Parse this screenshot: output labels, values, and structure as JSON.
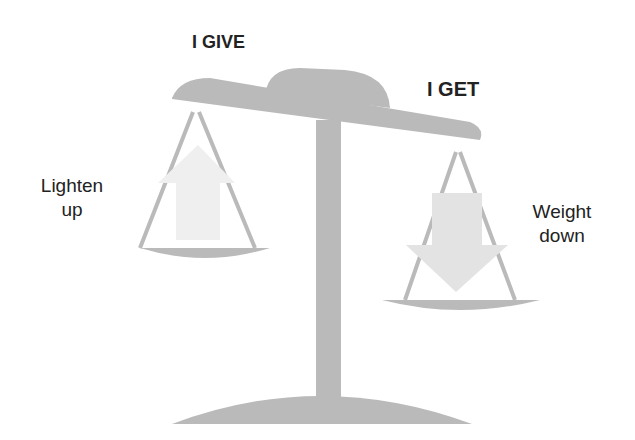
{
  "diagram": {
    "title_left": "I GIVE",
    "title_right": "I GET",
    "left_pan_label_line1": "Lighten",
    "left_pan_label_line2": "up",
    "right_pan_label_line1": "Weight",
    "right_pan_label_line2": "down",
    "colors": {
      "scale": "#b9b9b9",
      "arrow_up": "#eeeeee",
      "arrow_down": "#e2e2e2",
      "text": "#222222"
    }
  }
}
